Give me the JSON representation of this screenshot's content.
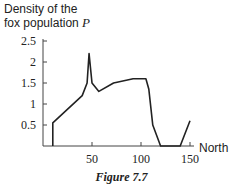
{
  "chart_data": {
    "type": "line",
    "title": "",
    "ylabel_line1": "Density of the",
    "ylabel_line2": "fox population",
    "ylabel_var": "P",
    "xlabel": "North",
    "caption": "Figure 7.7",
    "xlim": [
      0,
      150
    ],
    "ylim": [
      0,
      2.5
    ],
    "x_ticks": [
      50,
      100,
      150
    ],
    "x_tick_labels": [
      "50",
      "100",
      "150"
    ],
    "y_ticks": [
      0.5,
      1,
      1.5,
      2,
      2.5
    ],
    "y_tick_labels": [
      "0.5",
      "1",
      "1.5",
      "2",
      "2.5"
    ],
    "grid": false,
    "series": [
      {
        "name": "Density of fox population P",
        "x": [
          10,
          10,
          40,
          45,
          47,
          50,
          57,
          72,
          92,
          105,
          108,
          112,
          120,
          140,
          150
        ],
        "y": [
          0,
          0.55,
          1.2,
          1.5,
          2.2,
          1.5,
          1.3,
          1.5,
          1.6,
          1.6,
          1.35,
          0.5,
          0,
          0,
          0.6
        ]
      }
    ]
  }
}
